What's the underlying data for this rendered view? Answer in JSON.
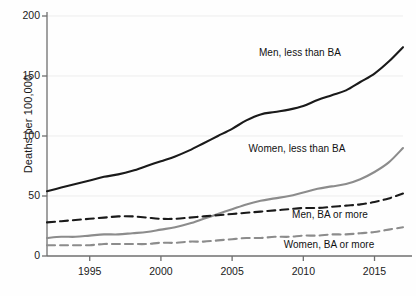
{
  "chart_data": {
    "type": "line",
    "title": "",
    "xlabel": "",
    "ylabel": "Deaths per 100,000",
    "xlim": [
      1992,
      2017
    ],
    "ylim": [
      0,
      200
    ],
    "grid": true,
    "legend_position": "inline-annotations",
    "xticks": [
      "1995",
      "2000",
      "2005",
      "2010",
      "2015"
    ],
    "xtick_values": [
      1995,
      2000,
      2005,
      2010,
      2015
    ],
    "yticks": [
      "0",
      "50",
      "100",
      "150",
      "200"
    ],
    "ytick_values": [
      0,
      50,
      100,
      150,
      200
    ],
    "x": [
      1992,
      1993,
      1994,
      1995,
      1996,
      1997,
      1998,
      1999,
      2000,
      2001,
      2002,
      2003,
      2004,
      2005,
      2006,
      2007,
      2008,
      2009,
      2010,
      2011,
      2012,
      2013,
      2014,
      2015,
      2016,
      2017
    ],
    "series": [
      {
        "name": "Men, less than BA",
        "color": "#1a1a1a",
        "style": "solid",
        "width": 2.1,
        "values": [
          54,
          57,
          60,
          63,
          66,
          68,
          71,
          75,
          79,
          83,
          88,
          94,
          100,
          106,
          113,
          118,
          120,
          122,
          125,
          130,
          134,
          138,
          145,
          152,
          162,
          174
        ]
      },
      {
        "name": "Women, less than BA",
        "color": "#8c8c8c",
        "style": "solid",
        "width": 2.1,
        "values": [
          15,
          16,
          16,
          17,
          18,
          18,
          19,
          20,
          22,
          24,
          27,
          31,
          35,
          39,
          43,
          46,
          48,
          50,
          53,
          56,
          58,
          60,
          64,
          70,
          78,
          90
        ]
      },
      {
        "name": "Men, BA or more",
        "color": "#1a1a1a",
        "style": "dashed",
        "width": 2.1,
        "values": [
          28,
          29,
          30,
          31,
          32,
          33,
          33,
          32,
          31,
          31,
          32,
          33,
          34,
          35,
          36,
          37,
          38,
          39,
          40,
          40,
          41,
          42,
          43,
          45,
          48,
          52
        ]
      },
      {
        "name": "Women, BA or more",
        "color": "#8c8c8c",
        "style": "dashed",
        "width": 2.1,
        "values": [
          9,
          9,
          9,
          9,
          10,
          10,
          10,
          10,
          11,
          11,
          12,
          12,
          13,
          14,
          15,
          15,
          16,
          16,
          17,
          17,
          18,
          18,
          19,
          20,
          22,
          24
        ]
      }
    ],
    "annotations": [
      {
        "text": "Men, less than BA",
        "x_px": 300,
        "y_px": 52
      },
      {
        "text": "Women, less than BA",
        "x_px": 297,
        "y_px": 148
      },
      {
        "text": "Men, BA or more",
        "x_px": 330,
        "y_px": 214
      },
      {
        "text": "Women, BA or more",
        "x_px": 329,
        "y_px": 244
      }
    ],
    "axis_color": "#6f6f6f",
    "grid_color": "#ededed",
    "text_color": "#1a1a1a",
    "background": "#ffffff"
  }
}
